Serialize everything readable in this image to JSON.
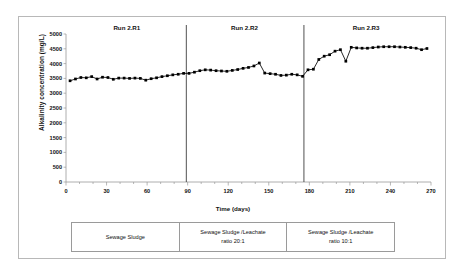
{
  "chart_data": {
    "type": "scatter",
    "title": "",
    "xlabel": "Time (days)",
    "ylabel": "Alkalinity concentration (mg/L)",
    "xlim": [
      0,
      270
    ],
    "ylim": [
      0,
      5000
    ],
    "xticks": [
      "0",
      "30",
      "60",
      "90",
      "120",
      "150",
      "180",
      "210",
      "240",
      "270"
    ],
    "yticks": [
      "0",
      "500",
      "1000",
      "1500",
      "2000",
      "2500",
      "3000",
      "3500",
      "4000",
      "4500",
      "5000"
    ],
    "grid": false,
    "legend": "none",
    "marker": "filled-square",
    "marker_color": "#000000",
    "line_color": "#000000",
    "x": [
      3,
      7,
      11,
      15,
      19,
      23,
      27,
      31,
      35,
      39,
      43,
      47,
      51,
      55,
      59,
      63,
      67,
      71,
      75,
      79,
      83,
      87,
      91,
      95,
      99,
      103,
      107,
      111,
      115,
      119,
      123,
      127,
      131,
      135,
      139,
      143,
      147,
      151,
      155,
      159,
      163,
      167,
      171,
      175,
      179,
      183,
      187,
      191,
      195,
      199,
      203,
      207,
      211,
      215,
      219,
      223,
      227,
      231,
      235,
      239,
      243,
      247,
      251,
      255,
      259,
      263,
      267
    ],
    "y": [
      3420,
      3480,
      3530,
      3520,
      3560,
      3480,
      3540,
      3530,
      3470,
      3510,
      3510,
      3500,
      3510,
      3500,
      3440,
      3490,
      3520,
      3560,
      3590,
      3620,
      3640,
      3670,
      3670,
      3710,
      3760,
      3790,
      3780,
      3760,
      3750,
      3740,
      3770,
      3800,
      3840,
      3870,
      3920,
      4020,
      3680,
      3660,
      3640,
      3600,
      3610,
      3640,
      3620,
      3570,
      3790,
      3810,
      4140,
      4250,
      4300,
      4420,
      4470,
      4080,
      4550,
      4530,
      4520,
      4520,
      4540,
      4560,
      4570,
      4570,
      4570,
      4560,
      4550,
      4540,
      4520,
      4470,
      4510
    ],
    "dividers": [
      89,
      176
    ],
    "annotations": [
      {
        "text": "Run 2.R1",
        "x": 45
      },
      {
        "text": "Run 2.R2",
        "x": 132
      },
      {
        "text": "Run 2.R3",
        "x": 222
      }
    ]
  },
  "conditions_table": {
    "cells": [
      {
        "line1": "Sewage Sludge",
        "line2": ""
      },
      {
        "line1": "Sewage Sludge /Leachate",
        "line2": "ratio 20:1"
      },
      {
        "line1": "Sewage Sludge /Leachate",
        "line2": "ratio 10:1"
      }
    ]
  }
}
